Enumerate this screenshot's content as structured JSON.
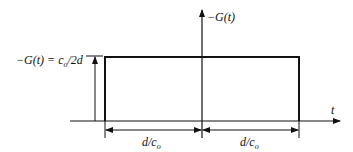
{
  "diagram": {
    "type": "rectangular-pulse",
    "labels": {
      "amplitude_lhs": "−G(t) = c",
      "amplitude_sub": "o",
      "amplitude_rhs": "/2d",
      "y_axis": "−G(t)",
      "x_axis": "t",
      "left_width_main": "d/c",
      "left_width_sub": "o",
      "right_width_main": "d/c",
      "right_width_sub": "o"
    },
    "colors": {
      "line": "#111111",
      "background": "#ffffff"
    }
  }
}
